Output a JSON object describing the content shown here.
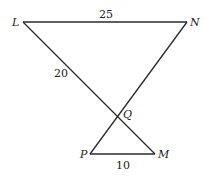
{
  "diagram": {
    "type": "geometry",
    "points": {
      "L": {
        "label": "L",
        "x": 23,
        "y": 22
      },
      "N": {
        "label": "N",
        "x": 187,
        "y": 22
      },
      "Q": {
        "label": "Q",
        "x": 117,
        "y": 116
      },
      "P": {
        "label": "P",
        "x": 90,
        "y": 154
      },
      "M": {
        "label": "M",
        "x": 155,
        "y": 154
      }
    },
    "segments": [
      {
        "from": "L",
        "to": "N",
        "length_label": "25"
      },
      {
        "from": "L",
        "to": "M",
        "length_label": "20"
      },
      {
        "from": "N",
        "to": "P",
        "length_label": ""
      },
      {
        "from": "P",
        "to": "M",
        "length_label": "10"
      }
    ],
    "labels": {
      "L": "L",
      "N": "N",
      "Q": "Q",
      "P": "P",
      "M": "M",
      "LN": "25",
      "LQ": "20",
      "PM": "10"
    }
  }
}
